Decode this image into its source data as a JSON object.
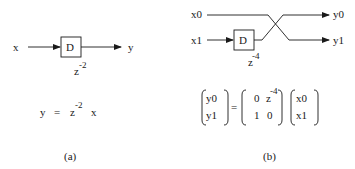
{
  "panel_a": {
    "input_label": "x",
    "output_label": "y",
    "block_label": "D",
    "delay_base": "z",
    "delay_exp": "-2",
    "equation": {
      "lhs": "y",
      "eq": "=",
      "z": "z",
      "exp": "-2",
      "rhs_var": "x"
    },
    "caption": "(a)"
  },
  "panel_b": {
    "inputs": [
      "x0",
      "x1"
    ],
    "outputs": [
      "y0",
      "y1"
    ],
    "block_label": "D",
    "delay_base": "z",
    "delay_exp": "-4",
    "matrix_equation": {
      "lhs_vector": [
        "y0",
        "y1"
      ],
      "eq": "=",
      "matrix": [
        [
          "0",
          "z",
          "-4"
        ],
        [
          "1",
          "0"
        ]
      ],
      "m00": "0",
      "m01_base": "z",
      "m01_exp": "-4",
      "m10": "1",
      "m11": "0",
      "rhs_vector": [
        "x0",
        "x1"
      ]
    },
    "caption": "(b)"
  },
  "colors": {
    "ink": "#1a1a1a",
    "background": "#ffffff"
  }
}
